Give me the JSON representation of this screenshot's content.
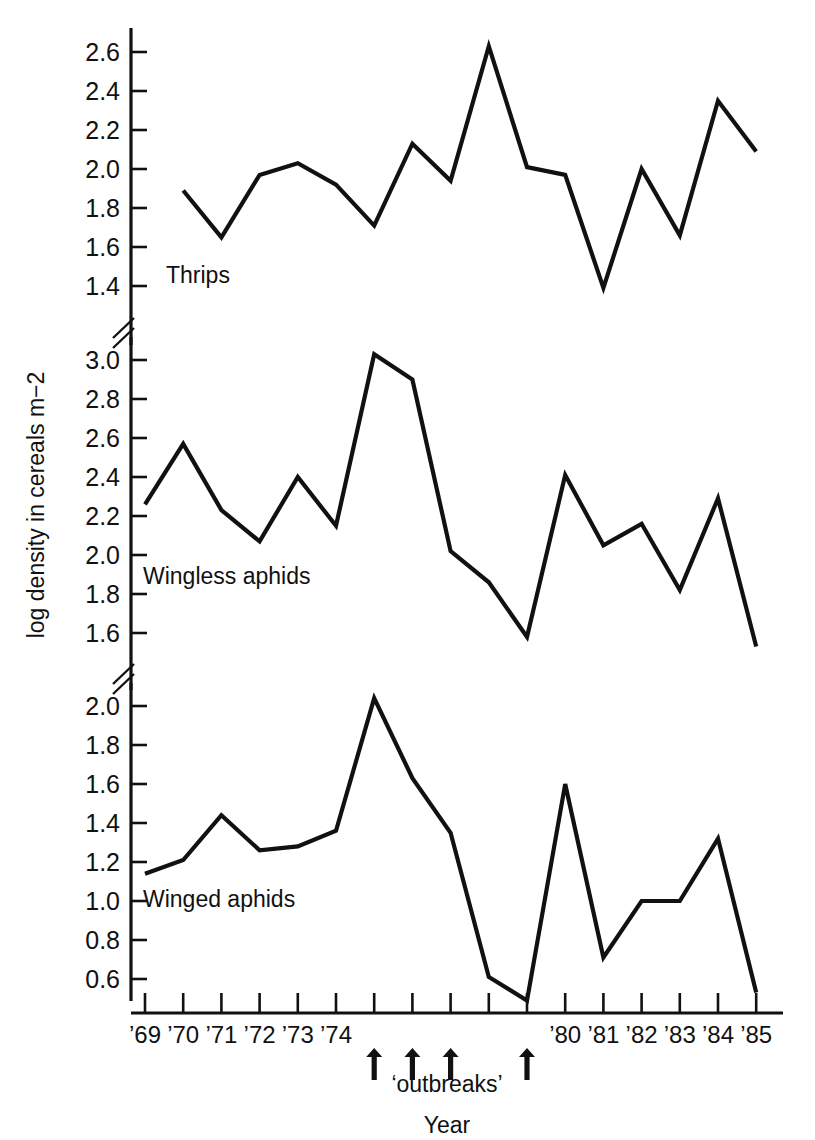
{
  "figure": {
    "page_number": "",
    "y_axis_title": "log density in cereals m−2",
    "x_axis_title": "Year",
    "outbreaks_label": "‘outbreaks’",
    "line_color": "#111111",
    "background_color": "#ffffff"
  },
  "panels": [
    {
      "id": "thrips",
      "series_label": "Thrips",
      "y_ticks": [
        "2.6",
        "2.4",
        "2.2",
        "2.0",
        "1.8",
        "1.6",
        "1.4"
      ],
      "y_tick_values": [
        2.6,
        2.4,
        2.2,
        2.0,
        1.8,
        1.6,
        1.4
      ],
      "ylim": [
        1.3,
        2.72
      ]
    },
    {
      "id": "wingless-aphids",
      "series_label": "Wingless aphids",
      "y_ticks": [
        "3.0",
        "2.8",
        "2.6",
        "2.4",
        "2.2",
        "2.0",
        "1.8",
        "1.6"
      ],
      "y_tick_values": [
        3.0,
        2.8,
        2.6,
        2.4,
        2.2,
        2.0,
        1.8,
        1.6
      ],
      "ylim": [
        1.48,
        3.1
      ]
    },
    {
      "id": "winged-aphids",
      "series_label": "Winged aphids",
      "y_ticks": [
        "2.0",
        "1.8",
        "1.6",
        "1.4",
        "1.2",
        "1.0",
        "0.8",
        "0.6"
      ],
      "y_tick_values": [
        2.0,
        1.8,
        1.6,
        1.4,
        1.2,
        1.0,
        0.8,
        0.6
      ],
      "ylim": [
        0.44,
        2.1
      ]
    }
  ],
  "x_axis": {
    "years": [
      1969,
      1970,
      1971,
      1972,
      1973,
      1974,
      1975,
      1976,
      1977,
      1978,
      1979,
      1980,
      1981,
      1982,
      1983,
      1984,
      1985
    ],
    "tick_labels": [
      "’69",
      "’70",
      "’71",
      "’72",
      "’73",
      "’74",
      "",
      "",
      "",
      "",
      "",
      "’80",
      "’81",
      "’82",
      "’83",
      "’84",
      "’85"
    ],
    "outbreak_years": [
      1975,
      1976,
      1977,
      1979
    ]
  },
  "chart_data": {
    "type": "line",
    "title": "",
    "subtitle": "",
    "xlabel": "Year",
    "ylabel": "log density in cereals m−2",
    "grid": false,
    "legend": "inline-labels",
    "x": [
      1969,
      1970,
      1971,
      1972,
      1973,
      1974,
      1975,
      1976,
      1977,
      1978,
      1979,
      1980,
      1981,
      1982,
      1983,
      1984,
      1985
    ],
    "xtick_labels": [
      "’69",
      "’70",
      "’71",
      "’72",
      "’73",
      "’74",
      "",
      "",
      "",
      "",
      "",
      "’80",
      "’81",
      "’82",
      "’83",
      "’84",
      "’85"
    ],
    "panels": [
      {
        "name": "Thrips",
        "ylim": [
          1.3,
          2.72
        ],
        "yticks": [
          1.4,
          1.6,
          1.8,
          2.0,
          2.2,
          2.4,
          2.6
        ],
        "values": [
          1.89,
          1.65,
          1.97,
          2.03,
          1.92,
          1.71,
          2.13,
          1.94,
          2.63,
          2.01,
          1.97,
          1.39,
          2.0,
          1.66,
          2.35,
          2.09
        ]
      },
      {
        "name": "Wingless aphids",
        "ylim": [
          1.48,
          3.1
        ],
        "yticks": [
          1.6,
          1.8,
          2.0,
          2.2,
          2.4,
          2.6,
          2.8,
          3.0
        ],
        "values": [
          2.26,
          2.57,
          2.23,
          2.07,
          2.4,
          2.15,
          3.03,
          2.9,
          2.02,
          1.86,
          1.58,
          2.41,
          2.05,
          2.16,
          1.82,
          2.29,
          1.53
        ]
      },
      {
        "name": "Winged aphids",
        "ylim": [
          0.44,
          2.1
        ],
        "yticks": [
          0.6,
          0.8,
          1.0,
          1.2,
          1.4,
          1.6,
          1.8,
          2.0
        ],
        "values": [
          1.14,
          1.21,
          1.44,
          1.26,
          1.28,
          1.36,
          2.04,
          1.63,
          1.35,
          0.61,
          0.49,
          1.6,
          0.71,
          1.0,
          1.0,
          1.32,
          0.53
        ]
      }
    ],
    "annotations": [
      {
        "text": "‘outbreaks’",
        "years": [
          1975,
          1976,
          1977,
          1979
        ],
        "marker": "up-arrow"
      }
    ]
  }
}
